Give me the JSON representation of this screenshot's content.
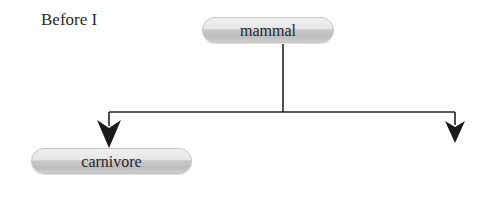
{
  "caption": "Before I",
  "diagram": {
    "type": "tree",
    "nodes": [
      {
        "id": "mammal",
        "label": "mammal"
      },
      {
        "id": "carnivore",
        "label": "carnivore"
      },
      {
        "id": "empty-right",
        "label": ""
      }
    ],
    "edges": [
      {
        "from": "mammal",
        "to": "carnivore",
        "style": "elbow-arrow"
      },
      {
        "from": "mammal",
        "to": "empty-right",
        "style": "elbow-arrow"
      }
    ]
  },
  "colors": {
    "line": "#222222",
    "node_border": "#c4c4c4",
    "text": "#262626"
  }
}
